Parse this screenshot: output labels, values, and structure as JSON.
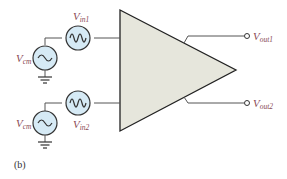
{
  "diagram": {
    "type": "differential amplifier",
    "caption": "(b)",
    "colors": {
      "amplifier_fill": "#e6e6dc",
      "source_fill": "#d6eaf5",
      "label_color": "#8a4a55",
      "wire": "#555555"
    },
    "inputs": [
      {
        "cm_label": "V",
        "cm_sub": "cm",
        "sig_label": "V",
        "sig_sub": "in1"
      },
      {
        "cm_label": "V",
        "cm_sub": "cm",
        "sig_label": "V",
        "sig_sub": "in2"
      }
    ],
    "outputs": [
      {
        "label": "V",
        "sub": "out1"
      },
      {
        "label": "V",
        "sub": "out2"
      }
    ]
  }
}
